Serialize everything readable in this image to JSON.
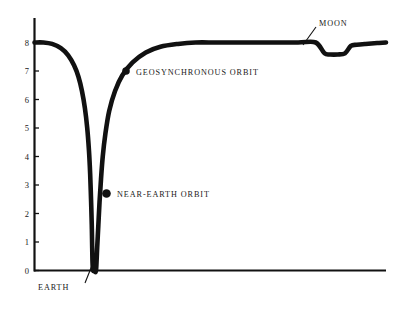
{
  "chart_data": {
    "type": "line",
    "title": "",
    "subtitle": "",
    "xlabel": "",
    "ylabel": "",
    "xlim": [
      0,
      12
    ],
    "ylim": [
      0,
      8.6
    ],
    "grid": false,
    "legend_position": "none",
    "y_ticks": [
      "0",
      "1",
      "2",
      "3",
      "4",
      "5",
      "6",
      "7",
      "8"
    ],
    "y_tick_values": [
      0,
      1,
      2,
      3,
      4,
      5,
      6,
      7,
      8
    ],
    "x_ticks": [],
    "series": [
      {
        "name": "gravity-potential-well",
        "x": [
          0.0,
          0.3,
          0.6,
          0.9,
          1.15,
          1.35,
          1.5,
          1.62,
          1.72,
          1.8,
          1.86,
          1.9,
          1.93,
          1.955,
          1.97,
          1.98,
          2.0,
          2.05,
          2.1,
          2.14,
          2.18,
          2.22,
          2.27,
          2.33,
          2.42,
          2.55,
          2.75,
          3.0,
          3.35,
          3.8,
          4.3,
          4.9,
          5.5,
          6.2,
          7.0,
          8.0,
          9.0,
          9.6,
          9.9,
          10.1,
          10.35,
          10.6,
          10.8,
          11.0,
          11.3,
          11.7,
          12.0
        ],
        "y": [
          8.0,
          8.0,
          7.95,
          7.8,
          7.55,
          7.2,
          6.8,
          6.3,
          5.7,
          5.0,
          4.2,
          3.4,
          2.5,
          1.6,
          0.8,
          0.3,
          0.0,
          0.0,
          0.0,
          0.8,
          1.6,
          2.4,
          3.2,
          4.0,
          4.8,
          5.6,
          6.3,
          6.85,
          7.3,
          7.65,
          7.85,
          7.95,
          8.0,
          8.0,
          8.0,
          8.0,
          8.0,
          8.0,
          7.62,
          7.58,
          7.58,
          7.62,
          7.88,
          7.92,
          7.95,
          7.98,
          8.0
        ]
      }
    ],
    "markers": [
      {
        "id": "near-earth-orbit",
        "label": "NEAR-EARTH ORBIT",
        "x": 2.24,
        "y": 2.7,
        "style": "filled-circle"
      },
      {
        "id": "geosynchronous-orbit",
        "label": "GEOSYNCHRONOUS ORBIT",
        "x": 3.22,
        "y": 7.0,
        "style": "filled-circle"
      }
    ],
    "annotations": [
      {
        "id": "earth",
        "label": "EARTH",
        "target_x": 2.02,
        "target_y": 0.55,
        "note": "leader line from label up to bottom of well"
      },
      {
        "id": "moon",
        "label": "MOON",
        "target_x": 10.05,
        "target_y": 7.7,
        "note": "leader line from label down to lunar dip"
      },
      {
        "id": "near-earth-orbit",
        "label": "NEAR-EARTH ORBIT",
        "target_x": 2.24,
        "target_y": 2.7
      },
      {
        "id": "geosynchronous-orbit",
        "label": "GEOSYNCHRONOUS ORBIT",
        "target_x": 3.22,
        "target_y": 7.0
      }
    ],
    "colors": {
      "curve": "#111111",
      "axis": "#111111",
      "text": "#1a1a1a",
      "background": "#ffffff"
    }
  },
  "axes": {
    "y_labels": [
      "8",
      "7",
      "6",
      "5",
      "4",
      "3",
      "2",
      "1",
      "0"
    ]
  },
  "labels": {
    "earth": "EARTH",
    "moon": "MOON",
    "near_earth_orbit": "NEAR-EARTH ORBIT",
    "geosynchronous_orbit": "GEOSYNCHRONOUS ORBIT"
  }
}
